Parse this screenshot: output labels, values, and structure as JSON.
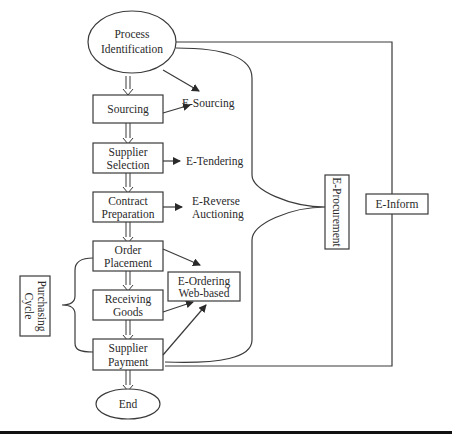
{
  "diagram": {
    "start_node": {
      "line1": "Process",
      "line2": "Identification"
    },
    "end_node": {
      "label": "End"
    },
    "process_steps": [
      {
        "line1": "Sourcing",
        "line2": ""
      },
      {
        "line1": "Supplier",
        "line2": "Selection"
      },
      {
        "line1": "Contract",
        "line2": "Preparation"
      },
      {
        "line1": "Order",
        "line2": "Placement"
      },
      {
        "line1": "Receiving",
        "line2": "Goods"
      },
      {
        "line1": "Supplier",
        "line2": "Payment"
      }
    ],
    "e_tools": {
      "e_sourcing": "E-Sourcing",
      "e_tendering": "E-Tendering",
      "e_reverse_line1": "E-Reverse",
      "e_reverse_line2": "Auctioning",
      "e_ordering_line1": "E-Ordering",
      "e_ordering_line2": "Web-based"
    },
    "groups": {
      "purchasing_cycle_line1": "Purchasing",
      "purchasing_cycle_line2": "Cycle",
      "e_procurement": "E-Procurement",
      "e_inform": "E-Inform"
    },
    "colors": {
      "stroke": "#3a3a3a",
      "text": "#2a2a2a",
      "rule": "#111111"
    }
  }
}
